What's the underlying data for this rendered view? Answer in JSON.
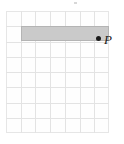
{
  "figure": {
    "canvas": {
      "width": 124,
      "height": 144,
      "background": "#ffffff"
    },
    "grid": {
      "name": "coordinate-grid",
      "columns": 7,
      "rows": 8,
      "origin_x": 6,
      "origin_y": 11,
      "cell_width": 14.7,
      "cell_height": 15.25,
      "line_color": "#e3e3e3",
      "border_color": "#e6e6e6",
      "cell_fill": "#fefefe"
    },
    "shapes": [
      {
        "name": "shaded-rectangle",
        "type": "rectangle",
        "col_start": 1,
        "col_span": 6,
        "row_start": 1,
        "row_span": 1,
        "fill_color": "#cacaca",
        "stroke_color": "#b4b4b4"
      }
    ],
    "points": [
      {
        "name": "point-p",
        "label": "P",
        "marker": "filled-dot",
        "marker_color": "#1a1a1a",
        "label_color": "#1a1a1a",
        "col": 7,
        "row": 2,
        "dot_x": 96,
        "dot_y": 36,
        "label_x": 104,
        "label_y": 33
      }
    ],
    "artifacts": [
      {
        "name": "top-speck",
        "x": 74,
        "y": 2,
        "width": 3,
        "height": 2,
        "color": "#d8d8d8"
      }
    ]
  }
}
